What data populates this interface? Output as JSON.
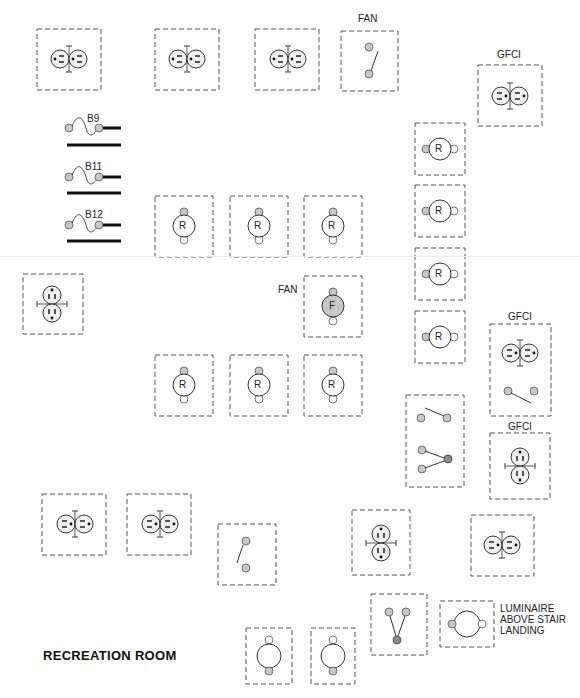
{
  "diagram": {
    "title": "RECREATION ROOM",
    "colors": {
      "line": "#333333",
      "dash": "#555555",
      "fill_gray": "#c8c8c8",
      "fill_dark": "#8a8a8a",
      "fill_light": "#f0f0f0"
    },
    "labels": {
      "fan_top": "FAN",
      "gfci_top": "GFCI",
      "fan_mid": "FAN",
      "gfci_right1": "GFCI",
      "gfci_right2": "GFCI",
      "luminaire_note_1": "LUMINAIRE",
      "luminaire_note_2": "ABOVE STAIR",
      "luminaire_note_3": "LANDING"
    },
    "breakers": [
      {
        "id": "B9",
        "label": "B9"
      },
      {
        "id": "B11",
        "label": "B11"
      },
      {
        "id": "B12",
        "label": "B12"
      }
    ],
    "fixtures": {
      "receptacle_letter": "R",
      "fan_letter": "F"
    },
    "components": [
      {
        "type": "duplex-receptacle",
        "x": 37,
        "y": 29
      },
      {
        "type": "duplex-receptacle",
        "x": 155,
        "y": 29
      },
      {
        "type": "duplex-receptacle",
        "x": 255,
        "y": 29
      },
      {
        "type": "single-pole-switch",
        "label": "FAN",
        "x": 341,
        "y": 31
      },
      {
        "type": "gfci-receptacle",
        "label": "GFCI",
        "x": 478,
        "y": 65
      },
      {
        "type": "lamp-receptacle",
        "letter": "R",
        "count": 4,
        "column": "right"
      },
      {
        "type": "lamp-receptacle",
        "letter": "R",
        "count": 3,
        "row": "upper"
      },
      {
        "type": "fan-fixture",
        "letter": "F",
        "label": "FAN"
      },
      {
        "type": "lamp-receptacle",
        "letter": "R",
        "count": 3,
        "row": "lower"
      },
      {
        "type": "duplex-receptacle-vertical",
        "x": 23,
        "y": 274
      },
      {
        "type": "gfci-with-switch",
        "label": "GFCI"
      },
      {
        "type": "three-way-switch-group"
      },
      {
        "type": "gfci-receptacle-vertical",
        "label": "GFCI"
      },
      {
        "type": "duplex-receptacle",
        "count": 2,
        "row": "bottom-left"
      },
      {
        "type": "single-pole-switch",
        "x": 218,
        "y": 522
      },
      {
        "type": "duplex-receptacle-vertical",
        "x": 352,
        "y": 510
      },
      {
        "type": "duplex-receptacle",
        "x": 471,
        "y": 515
      },
      {
        "type": "switch-v",
        "x": 371,
        "y": 595
      },
      {
        "type": "luminaire",
        "note": "LUMINAIRE ABOVE STAIR LANDING"
      },
      {
        "type": "luminaire",
        "count": 2,
        "row": "bottom"
      }
    ]
  }
}
